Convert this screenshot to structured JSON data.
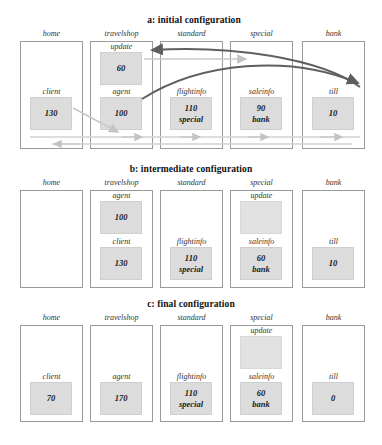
{
  "colors": {
    "box_fill": "#dcdcdc",
    "dark_arrow": "#5f5f5f",
    "light_arrow": "#c8c8c8",
    "frame": "#9a9a9a"
  },
  "columns": [
    "home",
    "travelshop",
    "standard",
    "special",
    "bank"
  ],
  "panels": [
    {
      "id": "a",
      "caption": "a: initial configuration",
      "columns": [
        {
          "name": "home",
          "slots": [
            {
              "label": "client",
              "value": "130",
              "sub": ""
            }
          ]
        },
        {
          "name": "travelshop",
          "slots": [
            {
              "label": "update",
              "value": "60",
              "sub": ""
            },
            {
              "label": "agent",
              "value": "100",
              "sub": ""
            }
          ]
        },
        {
          "name": "standard",
          "slots": [
            {
              "label": "flightinfo",
              "value": "110",
              "sub": "special"
            }
          ]
        },
        {
          "name": "special",
          "slots": [
            {
              "label": "saleinfo",
              "value": "90",
              "sub": "bank"
            }
          ]
        },
        {
          "name": "bank",
          "slots": [
            {
              "label": "till",
              "value": "10",
              "sub": ""
            }
          ]
        }
      ]
    },
    {
      "id": "b",
      "caption": "b: intermediate configuration",
      "columns": [
        {
          "name": "home",
          "slots": []
        },
        {
          "name": "travelshop",
          "slots": [
            {
              "label": "agent",
              "value": "100",
              "sub": ""
            },
            {
              "label": "client",
              "value": "130",
              "sub": ""
            }
          ]
        },
        {
          "name": "standard",
          "slots": [
            {
              "label": "flightinfo",
              "value": "110",
              "sub": "special"
            }
          ]
        },
        {
          "name": "special",
          "slots": [
            {
              "label": "update",
              "value": "",
              "sub": ""
            },
            {
              "label": "saleinfo",
              "value": "60",
              "sub": "bank"
            }
          ]
        },
        {
          "name": "bank",
          "slots": [
            {
              "label": "till",
              "value": "10",
              "sub": ""
            }
          ]
        }
      ]
    },
    {
      "id": "c",
      "caption": "c: final configuration",
      "columns": [
        {
          "name": "home",
          "slots": [
            {
              "label": "client",
              "value": "70",
              "sub": ""
            }
          ]
        },
        {
          "name": "travelshop",
          "slots": [
            {
              "label": "agent",
              "value": "170",
              "sub": ""
            }
          ]
        },
        {
          "name": "standard",
          "slots": [
            {
              "label": "flightinfo",
              "value": "110",
              "sub": "special"
            }
          ]
        },
        {
          "name": "special",
          "slots": [
            {
              "label": "update",
              "value": "",
              "sub": ""
            },
            {
              "label": "saleinfo",
              "value": "60",
              "sub": "bank"
            }
          ]
        },
        {
          "name": "bank",
          "slots": [
            {
              "label": "till",
              "value": "0",
              "sub": ""
            }
          ]
        }
      ]
    }
  ]
}
